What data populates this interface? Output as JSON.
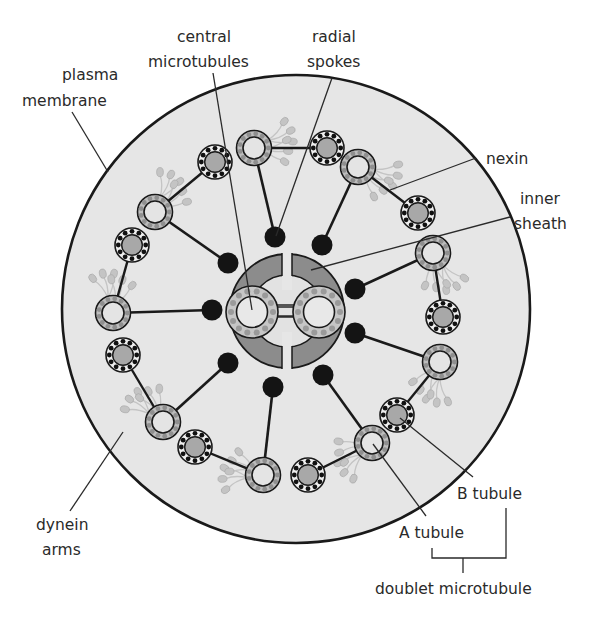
{
  "labels": {
    "plasma_membrane": [
      "plasma",
      "membrane"
    ],
    "central_microtubules": [
      "central",
      "microtubules"
    ],
    "radial_spokes": [
      "radial",
      "spokes"
    ],
    "nexin": [
      "nexin"
    ],
    "inner_sheath": [
      "inner",
      "sheath"
    ],
    "dynein_arms": [
      "dynein",
      "arms"
    ],
    "b_tubule": [
      "B tubule"
    ],
    "a_tubule": [
      "A tubule"
    ],
    "doublet_microtubule": [
      "doublet microtubule"
    ]
  },
  "colors": {
    "membrane_fill": "#e6e6e6",
    "outline": "#1a1a1a",
    "a_tubule_ring": "#bdbdbd",
    "a_tubule_dots": "#8f8f8f",
    "a_tubule_core": "#e4e4e4",
    "b_tubule_core": "#a8a8a8",
    "b_tubule_dots": "#111111",
    "b_tubule_ring": "#efefef",
    "sheath": "#8c8c8c",
    "spoke_head": "#141414",
    "dynein": "#b5b5b5"
  },
  "structure": {
    "outer_doublets": 9,
    "central_microtubules": 2
  }
}
